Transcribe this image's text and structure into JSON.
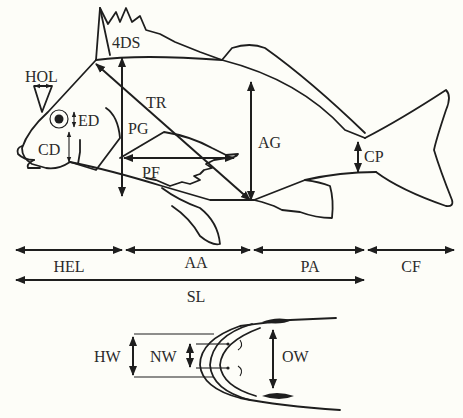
{
  "figure": {
    "background": "#fdfdf8",
    "ink": "#1e1e1e"
  },
  "labels": {
    "fourth_dorsal_spine": "4DS",
    "horizontal_orbit": "HOL",
    "eye_diameter": "ED",
    "cheek_depth": "CD",
    "trunk": "TR",
    "pectoral_girdle": "PG",
    "pectoral_fin": "PF",
    "anal_girdle": "AG",
    "caudal_peduncle": "CP"
  },
  "length_segments": {
    "row1": [
      {
        "label": "HEL"
      },
      {
        "label": "AA"
      },
      {
        "label": "PA"
      },
      {
        "label": "CF"
      }
    ],
    "standard_length": "SL"
  },
  "head_view": {
    "head_width": "HW",
    "nasal_width": "NW",
    "opercular_width": "OW"
  }
}
